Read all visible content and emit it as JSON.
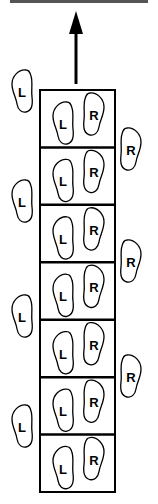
{
  "diagram": {
    "type": "footwork-ladder",
    "direction_arrow": "up",
    "ladder": {
      "rung_count": 7,
      "left_label": "L",
      "right_label": "R"
    },
    "outside_left": [
      {
        "label": "L"
      },
      {
        "label": "L"
      },
      {
        "label": "L"
      },
      {
        "label": "L"
      }
    ],
    "outside_right": [
      {
        "label": "R"
      },
      {
        "label": "R"
      },
      {
        "label": "R"
      }
    ],
    "colors": {
      "stroke": "#000000",
      "background": "#ffffff",
      "top_bar": "#555555"
    }
  }
}
